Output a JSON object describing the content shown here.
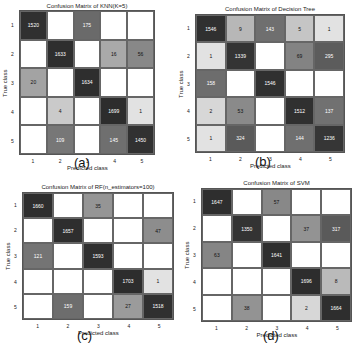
{
  "chart_data": [
    {
      "type": "heatmap",
      "panel": "(a)",
      "title": "Confusion Matrix of KNN(K=5)",
      "xlabel": "Predicted class",
      "ylabel": "True class",
      "x_ticks": [
        "1",
        "2",
        "3",
        "4",
        "5"
      ],
      "y_ticks": [
        "1",
        "2",
        "3",
        "4",
        "5"
      ],
      "matrix": [
        [
          1520,
          null,
          175,
          null,
          null
        ],
        [
          null,
          1633,
          null,
          16,
          56
        ],
        [
          20,
          null,
          1634,
          null,
          null
        ],
        [
          null,
          4,
          null,
          1699,
          1
        ],
        [
          null,
          109,
          null,
          145,
          1450
        ]
      ]
    },
    {
      "type": "heatmap",
      "panel": "(b)",
      "title": "Confusion Matrix of Decision Tree",
      "xlabel": "Predicted class",
      "ylabel": "True class",
      "x_ticks": [
        "1",
        "2",
        "3",
        "4",
        "5"
      ],
      "y_ticks": [
        "1",
        "2",
        "3",
        "4",
        "5"
      ],
      "matrix": [
        [
          1546,
          9,
          143,
          5,
          1
        ],
        [
          1,
          1339,
          null,
          69,
          295
        ],
        [
          158,
          null,
          1546,
          null,
          null
        ],
        [
          2,
          53,
          null,
          1512,
          137
        ],
        [
          1,
          324,
          null,
          144,
          1236
        ]
      ]
    },
    {
      "type": "heatmap",
      "panel": "(c)",
      "title": "Confusion Matrix of RF(n_estimators=100)",
      "xlabel": "Predicted class",
      "ylabel": "True class",
      "x_ticks": [
        "1",
        "2",
        "3",
        "4",
        "5"
      ],
      "y_ticks": [
        "1",
        "2",
        "3",
        "4",
        "5"
      ],
      "matrix": [
        [
          1660,
          null,
          35,
          null,
          null
        ],
        [
          null,
          1657,
          null,
          null,
          47
        ],
        [
          121,
          null,
          1593,
          null,
          null
        ],
        [
          null,
          null,
          null,
          1703,
          1
        ],
        [
          null,
          159,
          null,
          27,
          1518
        ]
      ]
    },
    {
      "type": "heatmap",
      "panel": "(d)",
      "title": "Confusion Matrix of SVM",
      "xlabel": "Predicted class",
      "ylabel": "True class",
      "x_ticks": [
        "1",
        "2",
        "3",
        "4",
        "5"
      ],
      "y_ticks": [
        "1",
        "2",
        "3",
        "4",
        "5"
      ],
      "matrix": [
        [
          1647,
          null,
          57,
          null,
          null
        ],
        [
          null,
          1350,
          null,
          37,
          317
        ],
        [
          63,
          null,
          1641,
          null,
          null
        ],
        [
          null,
          null,
          null,
          1696,
          8
        ],
        [
          null,
          38,
          null,
          2,
          1664
        ]
      ]
    }
  ],
  "layout": [
    {
      "grid": {
        "x": 19,
        "y": 10,
        "w": 136,
        "h": 145
      },
      "title_y": 3,
      "caption_x": 82,
      "caption_y": 163
    },
    {
      "grid": {
        "x": 195,
        "y": 14,
        "w": 150,
        "h": 139
      },
      "title_y": 6,
      "caption_x": 263,
      "caption_y": 162
    },
    {
      "grid": {
        "x": 22,
        "y": 192,
        "w": 152,
        "h": 128
      },
      "title_y": 184,
      "caption_x": 85,
      "caption_y": 336
    },
    {
      "grid": {
        "x": 201,
        "y": 188,
        "w": 151,
        "h": 134
      },
      "title_y": 180,
      "caption_x": 271,
      "caption_y": 336
    }
  ]
}
